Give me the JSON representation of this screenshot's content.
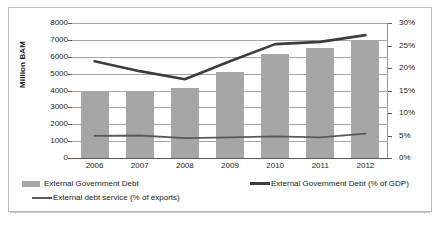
{
  "chart_data": {
    "type": "bar",
    "title": "",
    "xlabel": "",
    "ylabel": "Million BAM",
    "y2label": "",
    "categories": [
      "2006",
      "2007",
      "2008",
      "2009",
      "2010",
      "2011",
      "2012"
    ],
    "ylim": [
      0,
      8000
    ],
    "y2lim": [
      0,
      30
    ],
    "yticks": [
      "0",
      "1000",
      "2000",
      "3000",
      "4000",
      "5000",
      "6000",
      "7000",
      "8000"
    ],
    "ytick_values": [
      0,
      1000,
      2000,
      3000,
      4000,
      5000,
      6000,
      7000,
      8000
    ],
    "y2ticks": [
      "0%",
      "5%",
      "10%",
      "15%",
      "20%",
      "25%",
      "30%"
    ],
    "y2tick_values": [
      0,
      5,
      10,
      15,
      20,
      25,
      30
    ],
    "grid": true,
    "legend_position": "bottom",
    "series": [
      {
        "name": "External Government Debt",
        "type": "bar",
        "axis": "left",
        "unit": "Million BAM",
        "color": "#a6a6a6",
        "values": [
          4000,
          3950,
          4150,
          5100,
          6150,
          6500,
          7000
        ]
      },
      {
        "name": "External Government Debt (% of GDP)",
        "type": "line",
        "axis": "right",
        "unit": "%",
        "color": "#3d3d3d",
        "values": [
          21.5,
          19.3,
          17.5,
          21.5,
          25.3,
          25.8,
          27.3
        ]
      },
      {
        "name": "External debt service (% of exports)",
        "type": "line",
        "axis": "right",
        "unit": "%",
        "color": "#5a5a5a",
        "values": [
          4.9,
          5.0,
          4.4,
          4.6,
          4.8,
          4.6,
          5.4
        ]
      }
    ]
  },
  "legend": {
    "items": [
      {
        "label": "External Government Debt",
        "marker": "bar-swatch"
      },
      {
        "label": "External Government Debt (% of GDP)",
        "marker": "thick-line-swatch"
      },
      {
        "label": "External debt service (% of exports)",
        "marker": "thin-line-swatch"
      }
    ]
  }
}
